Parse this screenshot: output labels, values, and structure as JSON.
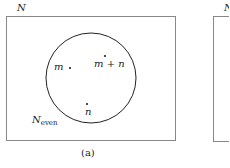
{
  "panels": [
    {
      "set_label": "N",
      "subset_label_main": "N",
      "subset_label_sub": "even",
      "points": [
        {
          "label": "m"
        },
        {
          "label": "m + n"
        },
        {
          "label": "n"
        }
      ],
      "caption": "(a)"
    },
    {
      "set_label": "N"
    }
  ],
  "colors": {
    "stroke": "#222222",
    "frame": "#888888"
  }
}
